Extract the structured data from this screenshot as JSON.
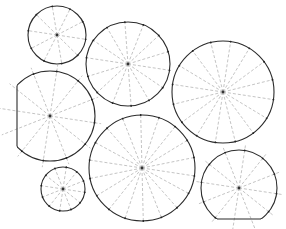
{
  "diagram": {
    "title": "Circle packing with radial spokes",
    "background": "#ffffff",
    "colors": {
      "outline": "#2b2b2b",
      "spoke": "#b5b5b5",
      "center": "#333333"
    },
    "shapes": [
      {
        "id": "circle-a",
        "cx": 57,
        "cy": 35,
        "r": 29,
        "spokes": 10,
        "clip": null
      },
      {
        "id": "circle-b",
        "cx": 128,
        "cy": 64,
        "r": 42,
        "spokes": 14,
        "clip": null
      },
      {
        "id": "circle-c",
        "cx": 223,
        "cy": 92,
        "r": 51,
        "spokes": 16,
        "clip": null
      },
      {
        "id": "circle-d",
        "cx": 50,
        "cy": 116,
        "r": 45,
        "spokes": 12,
        "clip": {
          "side": "left",
          "at": 17
        }
      },
      {
        "id": "circle-e",
        "cx": 142,
        "cy": 168,
        "r": 53,
        "spokes": 18,
        "clip": null
      },
      {
        "id": "circle-f",
        "cx": 63,
        "cy": 189,
        "r": 22,
        "spokes": 12,
        "clip": null
      },
      {
        "id": "circle-g",
        "cx": 239,
        "cy": 188,
        "r": 38,
        "spokes": 12,
        "clip": {
          "side": "bottom",
          "at": 219
        }
      }
    ]
  }
}
